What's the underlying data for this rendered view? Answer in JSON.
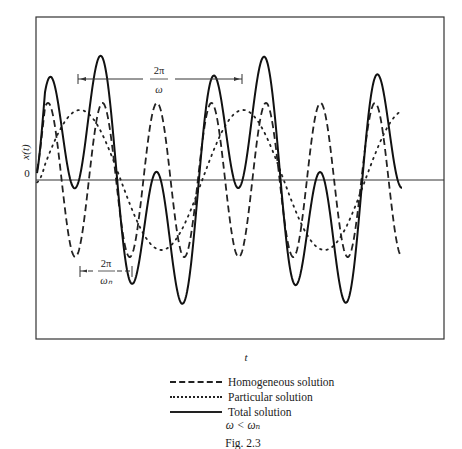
{
  "chart_data": {
    "type": "line",
    "title": "",
    "xlabel": "t",
    "ylabel": "x(t)",
    "y_tick_labels": [
      "0"
    ],
    "grid": false,
    "legend_position": "below",
    "condition": "ω < ωₙ",
    "figure_caption": "Fig. 2.3",
    "annotations": [
      {
        "text_top": "2π",
        "text_bottom": "ω",
        "meaning": "period of forcing (particular solution)",
        "x_from_px": 78,
        "x_to_px": 242,
        "y_px": 79
      },
      {
        "text_top": "2π",
        "text_bottom": "ωₙ",
        "meaning": "natural period (homogeneous solution)",
        "x_from_px": 79,
        "x_to_px": 132,
        "y_px": 271
      }
    ],
    "plot_frame_px": {
      "x0": 36,
      "y0": 17,
      "x1": 444,
      "y1": 339,
      "zero_line_y": 180
    },
    "series": [
      {
        "name": "Homogeneous solution",
        "style": "dashed",
        "description": "sinusoid at natural frequency ωₙ, amplitude ≈ 0.55 (relative), ~7 cycles across plot",
        "amplitude": 0.55,
        "period_px": 54.5,
        "phase_peak_x_px": 48,
        "peaks_x_px": [
          48,
          103,
          158,
          211,
          266,
          320,
          376
        ],
        "troughs_x_px": [
          76,
          130,
          185,
          239,
          293,
          348,
          402
        ]
      },
      {
        "name": "Particular solution",
        "style": "dotted",
        "description": "sinusoid at forcing frequency ω < ωₙ, amplitude ≈ 0.5 (relative), ~2.4 cycles",
        "amplitude": 0.5,
        "period_px": 163,
        "peaks_x_px": [
          80,
          243,
          400
        ],
        "troughs_x_px": [
          162,
          325
        ]
      },
      {
        "name": "Total solution",
        "style": "solid",
        "description": "sum of homogeneous and particular solutions (beat-like pattern)",
        "peaks_approx": [
          {
            "x_px": 51,
            "y_px": 67
          },
          {
            "x_px": 100,
            "y_px": 56
          },
          {
            "x_px": 158,
            "y_px": 175
          },
          {
            "x_px": 213,
            "y_px": 66
          },
          {
            "x_px": 263,
            "y_px": 51
          },
          {
            "x_px": 320,
            "y_px": 171
          },
          {
            "x_px": 376,
            "y_px": 73
          }
        ],
        "troughs_approx": [
          {
            "x_px": 78,
            "y_px": 188
          },
          {
            "x_px": 134,
            "y_px": 289
          },
          {
            "x_px": 185,
            "y_px": 292
          },
          {
            "x_px": 239,
            "y_px": 183
          },
          {
            "x_px": 297,
            "y_px": 280
          },
          {
            "x_px": 347,
            "y_px": 304
          }
        ]
      }
    ]
  },
  "axes": {
    "y_label": "x(t)",
    "y_zero": "0",
    "x_label": "t"
  },
  "period_labels": {
    "forcing_top": "2π",
    "forcing_bottom": "ω",
    "natural_top": "2π",
    "natural_bottom": "ωₙ"
  },
  "legend": {
    "items": [
      {
        "label": "Homogeneous solution"
      },
      {
        "label": "Particular solution"
      },
      {
        "label": "Total solution"
      }
    ],
    "condition": "ω < ωₙ"
  },
  "caption": "Fig. 2.3"
}
